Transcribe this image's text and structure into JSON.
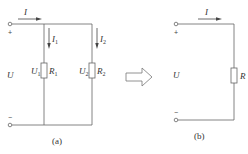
{
  "figure_a": {
    "caption": "(a)",
    "current_total": "I",
    "voltage": "U",
    "plus": "+",
    "minus": "−",
    "branch1": {
      "current": "I",
      "current_sub": "1",
      "voltage": "U",
      "voltage_sub": "1",
      "resistor": "R",
      "resistor_sub": "1"
    },
    "branch2": {
      "current": "I",
      "current_sub": "2",
      "voltage": "U",
      "voltage_sub": "2",
      "resistor": "R",
      "resistor_sub": "2"
    }
  },
  "figure_b": {
    "caption": "(b)",
    "current": "I",
    "voltage": "U",
    "plus": "+",
    "minus": "−",
    "resistor": "R"
  },
  "colors": {
    "wire": "#666666",
    "text": "#333333"
  }
}
